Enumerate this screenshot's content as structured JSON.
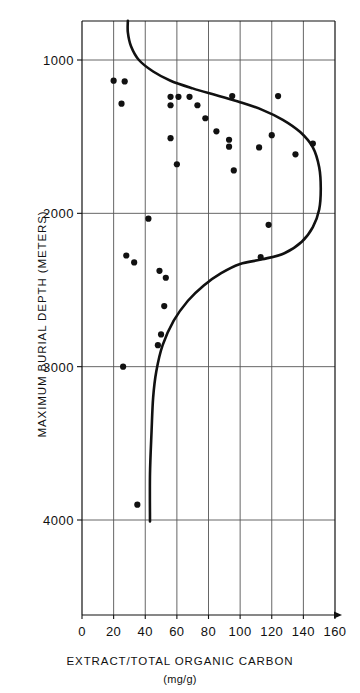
{
  "chart_data": {
    "type": "scatter",
    "title": "",
    "xlabel": "EXTRACT/TOTAL ORGANIC CARBON",
    "xunits": "(mg/g)",
    "ylabel": "MAXIMUM BURIAL DEPTH (METERS)",
    "xlim": [
      0,
      160
    ],
    "ylim": [
      4620,
      745
    ],
    "y_inverted": true,
    "grid": true,
    "legend": null,
    "x_ticks": [
      0,
      20,
      40,
      60,
      80,
      100,
      120,
      140,
      160
    ],
    "x_tick_labels": [
      "0",
      "20",
      "40",
      "60",
      "80",
      "100",
      "120",
      "140",
      "160"
    ],
    "y_ticks": [
      1000,
      2000,
      3000,
      4000
    ],
    "y_tick_labels": [
      "1000",
      "2000",
      "3000",
      "4000"
    ],
    "x_minor_gridlines": [
      20,
      40,
      60,
      80,
      100,
      120,
      140
    ],
    "x_axis_arrow": true,
    "series": [
      {
        "name": "samples",
        "type": "scatter",
        "marker": "filled-circle",
        "color": "#111111",
        "points": [
          {
            "x": 20,
            "y": 1135
          },
          {
            "x": 27,
            "y": 1140
          },
          {
            "x": 25,
            "y": 1285
          },
          {
            "x": 56,
            "y": 1240
          },
          {
            "x": 61,
            "y": 1240
          },
          {
            "x": 68,
            "y": 1240
          },
          {
            "x": 95,
            "y": 1235
          },
          {
            "x": 124,
            "y": 1235
          },
          {
            "x": 56,
            "y": 1295
          },
          {
            "x": 73,
            "y": 1295
          },
          {
            "x": 78,
            "y": 1380
          },
          {
            "x": 85,
            "y": 1465
          },
          {
            "x": 56,
            "y": 1510
          },
          {
            "x": 120,
            "y": 1490
          },
          {
            "x": 93,
            "y": 1520
          },
          {
            "x": 146,
            "y": 1545
          },
          {
            "x": 93,
            "y": 1565
          },
          {
            "x": 112,
            "y": 1570
          },
          {
            "x": 135,
            "y": 1615
          },
          {
            "x": 60,
            "y": 1680
          },
          {
            "x": 96,
            "y": 1720
          },
          {
            "x": 42,
            "y": 2035
          },
          {
            "x": 118,
            "y": 2075
          },
          {
            "x": 28,
            "y": 2275
          },
          {
            "x": 33,
            "y": 2320
          },
          {
            "x": 113,
            "y": 2285
          },
          {
            "x": 49,
            "y": 2375
          },
          {
            "x": 53,
            "y": 2420
          },
          {
            "x": 52,
            "y": 2605
          },
          {
            "x": 50,
            "y": 2790
          },
          {
            "x": 48,
            "y": 2860
          },
          {
            "x": 26,
            "y": 3000
          },
          {
            "x": 35,
            "y": 3900
          }
        ]
      },
      {
        "name": "trend-curve",
        "type": "line",
        "color": "#111111",
        "points": [
          {
            "x": 29,
            "y": 745
          },
          {
            "x": 29,
            "y": 820
          },
          {
            "x": 31,
            "y": 910
          },
          {
            "x": 36,
            "y": 1000
          },
          {
            "x": 45,
            "y": 1075
          },
          {
            "x": 56,
            "y": 1135
          },
          {
            "x": 70,
            "y": 1185
          },
          {
            "x": 85,
            "y": 1230
          },
          {
            "x": 100,
            "y": 1275
          },
          {
            "x": 114,
            "y": 1325
          },
          {
            "x": 127,
            "y": 1390
          },
          {
            "x": 138,
            "y": 1470
          },
          {
            "x": 146,
            "y": 1570
          },
          {
            "x": 150,
            "y": 1700
          },
          {
            "x": 151,
            "y": 1840
          },
          {
            "x": 150,
            "y": 1975
          },
          {
            "x": 146,
            "y": 2090
          },
          {
            "x": 139,
            "y": 2185
          },
          {
            "x": 128,
            "y": 2260
          },
          {
            "x": 114,
            "y": 2300
          },
          {
            "x": 100,
            "y": 2330
          },
          {
            "x": 88,
            "y": 2390
          },
          {
            "x": 77,
            "y": 2470
          },
          {
            "x": 67,
            "y": 2570
          },
          {
            "x": 58,
            "y": 2700
          },
          {
            "x": 51,
            "y": 2860
          },
          {
            "x": 47,
            "y": 3030
          },
          {
            "x": 45,
            "y": 3200
          },
          {
            "x": 44,
            "y": 3420
          },
          {
            "x": 43,
            "y": 3700
          },
          {
            "x": 43,
            "y": 4010
          }
        ]
      }
    ]
  },
  "axes": {
    "x_title": "EXTRACT/TOTAL ORGANIC CARBON",
    "x_units": "(mg/g)",
    "y_title": "MAXIMUM BURIAL DEPTH (METERS)"
  },
  "style": {
    "ink": "#111111",
    "grid_color": "#555555",
    "background": "#ffffff"
  }
}
